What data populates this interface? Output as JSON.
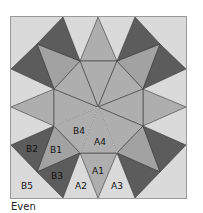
{
  "caption": "Even",
  "colors": {
    "background": "#dadada",
    "dark": "#5c5c5c",
    "medium": "#a2a2a2",
    "center": "#aeaeae",
    "line": "#3a3a3a",
    "highlight_line": "#d8d8d8",
    "border": "#9a9a9a"
  },
  "labels": {
    "A1": "A1",
    "A2": "A2",
    "A3": "A3",
    "A4": "A4",
    "B1": "B1",
    "B2": "B2",
    "B3": "B3",
    "B4": "B4",
    "B5": "B5"
  },
  "diagram": {
    "type": "quilt-block",
    "pattern": "eight-pointed star with dark triangle pairs"
  }
}
